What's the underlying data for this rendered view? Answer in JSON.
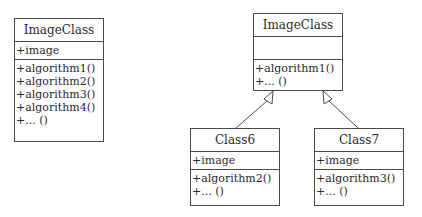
{
  "diagram": {
    "left_class": {
      "name": "ImageClass",
      "attributes": [
        "+image"
      ],
      "operations": [
        "+algorithm1()",
        "+algorithm2()",
        "+algorithm3()",
        "+algorithm4()",
        "+... ()"
      ]
    },
    "parent_class": {
      "name": "ImageClass",
      "attributes": [],
      "operations": [
        "+algorithm1()",
        "+... ()"
      ]
    },
    "child_class_1": {
      "name": "Class6",
      "attributes": [
        "+image"
      ],
      "operations": [
        "+algorithm2()",
        "+... ()"
      ]
    },
    "child_class_2": {
      "name": "Class7",
      "attributes": [
        "+image"
      ],
      "operations": [
        "+algorithm3()",
        "+... ()"
      ]
    },
    "relations": [
      {
        "type": "generalization",
        "from": "Class6",
        "to": "ImageClass"
      },
      {
        "type": "generalization",
        "from": "Class7",
        "to": "ImageClass"
      }
    ],
    "colors": {
      "line": "#4a4a4a",
      "background": "#ffffff",
      "text": "#2a2a2a"
    }
  }
}
